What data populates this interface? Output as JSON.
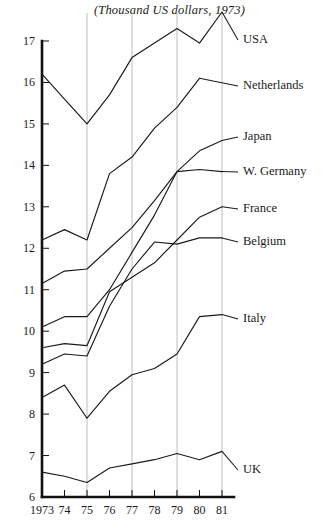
{
  "title": "(Thousand US dollars, 1973)",
  "chart_data": {
    "type": "line",
    "title": "(Thousand US dollars, 1973)",
    "xlabel": "",
    "ylabel": "",
    "xlim": [
      1973,
      1981
    ],
    "ylim": [
      6,
      17
    ],
    "grid": "vertical gridlines at 1975, 1977, 1979, 1981",
    "legend_position": "right, direct series labels",
    "x": [
      1973,
      1974,
      1975,
      1976,
      1977,
      1978,
      1979,
      1980,
      1981
    ],
    "x_ticklabels": [
      "1973",
      "74",
      "75",
      "76",
      "77",
      "78",
      "79",
      "80",
      "81"
    ],
    "y_ticklabels": [
      "6",
      "7",
      "8",
      "9",
      "10",
      "11",
      "12",
      "13",
      "14",
      "15",
      "16",
      "17"
    ],
    "series": [
      {
        "name": "USA",
        "label": "USA",
        "values": [
          16.2,
          15.6,
          15.0,
          15.7,
          16.6,
          16.95,
          17.3,
          16.95,
          17.7
        ]
      },
      {
        "name": "Netherlands",
        "label": "Netherlands",
        "values": [
          12.2,
          12.45,
          12.2,
          13.8,
          14.2,
          14.9,
          15.4,
          16.1,
          null
        ]
      },
      {
        "name": "Japan",
        "label": "Japan",
        "values": [
          11.15,
          11.45,
          11.5,
          12.0,
          12.5,
          13.15,
          13.85,
          14.35,
          14.6
        ]
      },
      {
        "name": "W. Germany",
        "label": "W. Germany",
        "values": [
          10.1,
          10.35,
          10.35,
          11.0,
          11.9,
          12.8,
          13.85,
          13.9,
          13.85
        ]
      },
      {
        "name": "France",
        "label": "France",
        "values": [
          9.6,
          9.7,
          9.65,
          10.95,
          11.3,
          11.65,
          12.2,
          12.75,
          13.0
        ]
      },
      {
        "name": "Belgium",
        "label": "Belgium",
        "values": [
          9.2,
          9.45,
          9.4,
          10.6,
          11.5,
          12.15,
          12.1,
          12.25,
          12.25
        ]
      },
      {
        "name": "Italy",
        "label": "Italy",
        "values": [
          8.4,
          8.7,
          7.9,
          8.55,
          8.95,
          9.1,
          9.45,
          10.35,
          10.4
        ]
      },
      {
        "name": "UK",
        "label": "UK",
        "values": [
          6.6,
          6.5,
          6.35,
          6.7,
          6.8,
          6.9,
          7.05,
          6.9,
          7.1
        ]
      }
    ]
  }
}
